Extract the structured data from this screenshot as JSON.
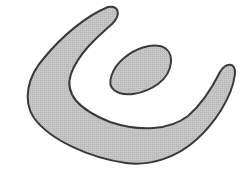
{
  "diagram": {
    "background": "#ffffff",
    "fill": "#c4c4c4",
    "stroke": "#3a3a3a",
    "shapes": [
      {
        "name": "crescent-shape",
        "type": "u-shaped crescent"
      },
      {
        "name": "ellipse-shape",
        "type": "ellipse"
      }
    ]
  }
}
